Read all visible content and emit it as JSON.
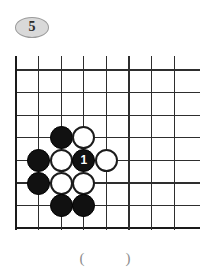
{
  "page": {
    "background_color": "#ffffff",
    "width": 210,
    "height": 279
  },
  "badge": {
    "label": "5",
    "fill_color": "#d9d9d9",
    "border_color": "#9a9a9a",
    "text_color": "#2b2b2b"
  },
  "board": {
    "type": "go-board-corner",
    "columns": 8,
    "rows": 8,
    "line_color": "#2e2e2e",
    "edge_color": "#1a1a1a",
    "origin_x": 16,
    "origin_y": 70,
    "spacing": 22.6,
    "corner": "bottom-left"
  },
  "stones": [
    {
      "color": "black",
      "col": 3,
      "row": 4,
      "label": ""
    },
    {
      "color": "white",
      "col": 4,
      "row": 4,
      "label": ""
    },
    {
      "color": "black",
      "col": 2,
      "row": 5,
      "label": ""
    },
    {
      "color": "white",
      "col": 3,
      "row": 5,
      "label": ""
    },
    {
      "color": "black",
      "col": 4,
      "row": 5,
      "label": "1"
    },
    {
      "color": "white",
      "col": 5,
      "row": 5,
      "label": ""
    },
    {
      "color": "black",
      "col": 2,
      "row": 6,
      "label": ""
    },
    {
      "color": "white",
      "col": 3,
      "row": 6,
      "label": ""
    },
    {
      "color": "white",
      "col": 4,
      "row": 6,
      "label": ""
    },
    {
      "color": "black",
      "col": 3,
      "row": 7,
      "label": ""
    },
    {
      "color": "black",
      "col": 4,
      "row": 7,
      "label": ""
    }
  ],
  "caption": {
    "text": "(           )",
    "color": "#8d8d8d"
  }
}
